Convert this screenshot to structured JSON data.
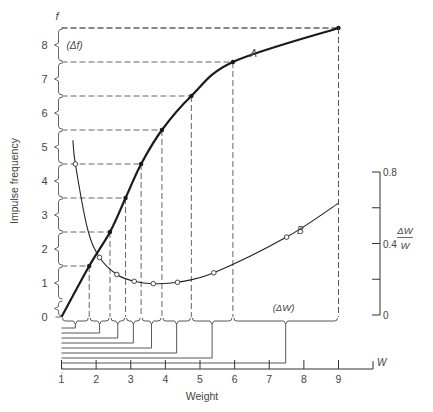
{
  "chart_data": {
    "type": "line",
    "title": "",
    "xlabel": "Weight",
    "x_axis_symbol": "W",
    "ylabel": "Impulse frequency",
    "y_axis_symbol": "f",
    "y2label_num": "ΔW",
    "y2label_den": "W",
    "xlim": [
      1,
      9
    ],
    "ylim": [
      0,
      8.5
    ],
    "y2lim": [
      0,
      0.8
    ],
    "x_ticks": [
      "1",
      "2",
      "3",
      "4",
      "5",
      "6",
      "7",
      "8",
      "9"
    ],
    "y_ticks": [
      "0",
      "1",
      "2",
      "3",
      "4",
      "5",
      "6",
      "7",
      "8"
    ],
    "y2_ticks": [
      "0",
      "0.4",
      "0.8"
    ],
    "grid": false,
    "annotations": {
      "delta_f": "(Δf)",
      "delta_w": "(ΔW)"
    },
    "series": [
      {
        "name": "A",
        "label": "A",
        "description": "Impulse frequency vs weight; filled points at equal frequency steps",
        "x": [
          1.0,
          1.8,
          2.4,
          2.85,
          3.3,
          3.9,
          4.75,
          5.95,
          9.0
        ],
        "y": [
          0.0,
          1.5,
          2.5,
          3.5,
          4.5,
          5.5,
          6.5,
          7.5,
          8.5
        ]
      },
      {
        "name": "B",
        "label": "B",
        "description": "Weber fraction ΔW/W vs weight (right axis); open points",
        "x": [
          1.35,
          2.1,
          2.6,
          3.1,
          3.65,
          4.35,
          5.4,
          7.5,
          9.0
        ],
        "y": [
          0.63,
          0.2,
          0.12,
          0.09,
          0.085,
          0.09,
          0.13,
          0.29,
          0.38
        ]
      }
    ],
    "delta_w_intervals": [
      [
        1.0,
        1.8
      ],
      [
        1.8,
        2.4
      ],
      [
        2.4,
        2.85
      ],
      [
        2.85,
        3.3
      ],
      [
        3.3,
        3.9
      ],
      [
        3.9,
        4.75
      ],
      [
        4.75,
        5.95
      ],
      [
        5.95,
        9.0
      ]
    ]
  }
}
